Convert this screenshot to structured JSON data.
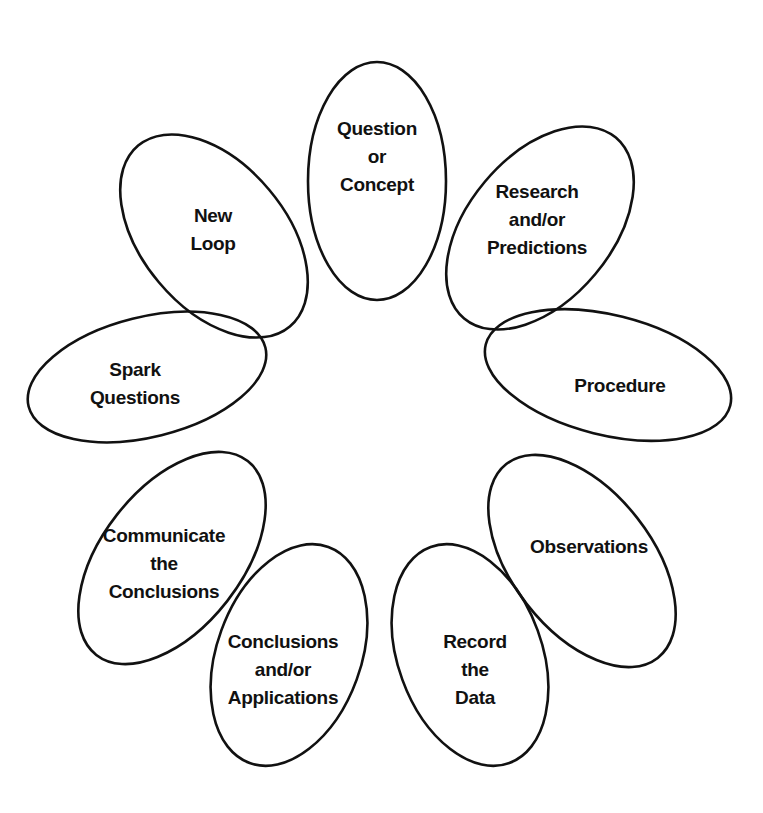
{
  "diagram": {
    "type": "cycle-flower",
    "petals": [
      {
        "id": "question",
        "lines": [
          "Question",
          "or",
          "Concept"
        ],
        "cx": 377,
        "cy": 181,
        "rx": 69,
        "ry": 119,
        "rot": 0,
        "tx": 377,
        "ty": 135
      },
      {
        "id": "research",
        "lines": [
          "Research",
          "and/or",
          "Predictions"
        ],
        "cx": 540,
        "cy": 228,
        "rx": 72,
        "ry": 118,
        "rot": 40,
        "tx": 537,
        "ty": 198
      },
      {
        "id": "procedure",
        "lines": [
          "Procedure"
        ],
        "cx": 608,
        "cy": 375,
        "rx": 126,
        "ry": 60,
        "rot": 14,
        "tx": 620,
        "ty": 392
      },
      {
        "id": "observations",
        "lines": [
          "Observations"
        ],
        "cx": 582,
        "cy": 561,
        "rx": 70,
        "ry": 123,
        "rot": -38,
        "tx": 589,
        "ty": 553
      },
      {
        "id": "record",
        "lines": [
          "Record",
          "the",
          "Data"
        ],
        "cx": 470,
        "cy": 655,
        "rx": 72,
        "ry": 115,
        "rot": -20,
        "tx": 475,
        "ty": 648
      },
      {
        "id": "conclusions",
        "lines": [
          "Conclusions",
          "and/or",
          "Applications"
        ],
        "cx": 289,
        "cy": 655,
        "rx": 72,
        "ry": 115,
        "rot": 20,
        "tx": 283,
        "ty": 648
      },
      {
        "id": "communicate",
        "lines": [
          "Communicate",
          "the",
          "Conclusions"
        ],
        "cx": 172,
        "cy": 558,
        "rx": 70,
        "ry": 123,
        "rot": 38,
        "tx": 164,
        "ty": 542
      },
      {
        "id": "spark",
        "lines": [
          "Spark",
          "Questions"
        ],
        "cx": 147,
        "cy": 377,
        "rx": 122,
        "ry": 60,
        "rot": -14,
        "tx": 135,
        "ty": 376
      },
      {
        "id": "new-loop",
        "lines": [
          "New",
          "Loop"
        ],
        "cx": 214,
        "cy": 236,
        "rx": 72,
        "ry": 118,
        "rot": -40,
        "tx": 213,
        "ty": 222
      }
    ],
    "line_height": 28,
    "stroke_color": "#111111",
    "background": "#ffffff"
  }
}
